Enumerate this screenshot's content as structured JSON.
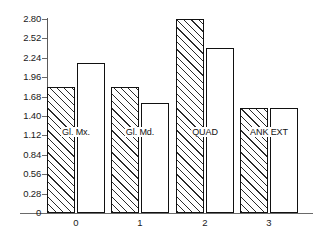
{
  "chart_data": {
    "type": "bar",
    "title": "",
    "xlabel": "",
    "ylabel": "",
    "ylim": [
      0,
      2.8
    ],
    "grid": false,
    "legend": null,
    "categories": [
      "0",
      "1",
      "2",
      "3"
    ],
    "group_captions": [
      "Gl. Mx.",
      "Gl. Md.",
      "QUAD",
      "ANK EXT"
    ],
    "series": [
      {
        "name": "hatched",
        "values": [
          1.82,
          1.82,
          2.8,
          1.52
        ]
      },
      {
        "name": "open",
        "values": [
          2.17,
          1.59,
          2.38,
          1.52
        ]
      }
    ],
    "yticks": [
      0,
      0.28,
      0.56,
      0.84,
      1.12,
      1.4,
      1.68,
      1.96,
      2.24,
      2.52,
      2.8
    ],
    "ytick_labels": [
      "0",
      "0.28",
      "0.56",
      "0.84",
      "1.12",
      "1.40",
      "1.68",
      "1.96",
      "2.24",
      "2.52",
      "2.80"
    ],
    "xtick_labels": [
      "0",
      "1",
      "2",
      "3"
    ],
    "caption_value": 1.17,
    "colors": {
      "axis": "#6a6a6a",
      "bar_outline": "#111111",
      "bar_fill": "#ffffff",
      "hatch": "#2b2b2b",
      "text": "#1a1a1a"
    }
  }
}
